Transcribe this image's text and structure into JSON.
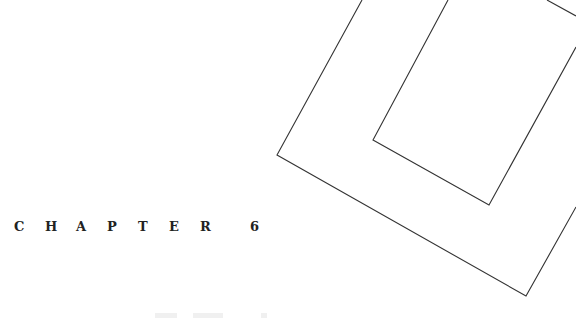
{
  "page": {
    "background": "#ffffff",
    "line_color": "#333333",
    "text_color": "#222222"
  },
  "chapter": {
    "word": "CHAPTER",
    "letters": [
      "C",
      "H",
      "A",
      "P",
      "T",
      "E",
      "R"
    ],
    "number": "6"
  },
  "decoration": {
    "shapes": [
      {
        "name": "outer-bracket",
        "points": "362,0 277,155 526,296 576,207"
      },
      {
        "name": "inner-bracket",
        "points": "448,0 373,140 489,205 576,47"
      },
      {
        "name": "top-right-line",
        "points": "547,0 576,16"
      }
    ]
  }
}
